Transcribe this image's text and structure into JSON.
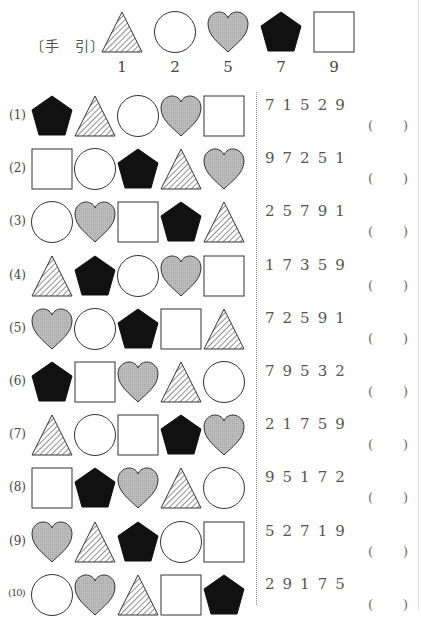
{
  "key": {
    "label": "〔手　引〕",
    "items": [
      {
        "shape": "hatched-triangle",
        "value": "1"
      },
      {
        "shape": "circle",
        "value": "2"
      },
      {
        "shape": "gray-heart",
        "value": "5"
      },
      {
        "shape": "black-pentagon",
        "value": "7"
      },
      {
        "shape": "square",
        "value": "9"
      }
    ]
  },
  "colors": {
    "heart_fill": "#b3b3b3",
    "pentagon_fill": "#111111",
    "stroke": "#333333"
  },
  "problems": [
    {
      "label": "(1)",
      "shapes": [
        "black-pentagon",
        "hatched-triangle",
        "circle",
        "gray-heart",
        "square"
      ],
      "digits": "71529",
      "answer_open": "(",
      "answer_close": ")"
    },
    {
      "label": "(2)",
      "shapes": [
        "square",
        "circle",
        "black-pentagon",
        "hatched-triangle",
        "gray-heart"
      ],
      "digits": "97251",
      "answer_open": "(",
      "answer_close": ")"
    },
    {
      "label": "(3)",
      "shapes": [
        "circle",
        "gray-heart",
        "square",
        "black-pentagon",
        "hatched-triangle"
      ],
      "digits": "25791",
      "answer_open": "(",
      "answer_close": ")"
    },
    {
      "label": "(4)",
      "shapes": [
        "hatched-triangle",
        "black-pentagon",
        "circle",
        "gray-heart",
        "square"
      ],
      "digits": "17359",
      "answer_open": "(",
      "answer_close": ")"
    },
    {
      "label": "(5)",
      "shapes": [
        "gray-heart",
        "circle",
        "black-pentagon",
        "square",
        "hatched-triangle"
      ],
      "digits": "72591",
      "answer_open": "(",
      "answer_close": ")"
    },
    {
      "label": "(6)",
      "shapes": [
        "black-pentagon",
        "square",
        "gray-heart",
        "hatched-triangle",
        "circle"
      ],
      "digits": "79532",
      "answer_open": "(",
      "answer_close": ")"
    },
    {
      "label": "(7)",
      "shapes": [
        "hatched-triangle",
        "circle",
        "square",
        "black-pentagon",
        "gray-heart"
      ],
      "digits": "21759",
      "answer_open": "(",
      "answer_close": ")"
    },
    {
      "label": "(8)",
      "shapes": [
        "square",
        "black-pentagon",
        "gray-heart",
        "hatched-triangle",
        "circle"
      ],
      "digits": "95172",
      "answer_open": "(",
      "answer_close": ")"
    },
    {
      "label": "(9)",
      "shapes": [
        "gray-heart",
        "hatched-triangle",
        "black-pentagon",
        "circle",
        "square"
      ],
      "digits": "52719",
      "answer_open": "(",
      "answer_close": ")"
    },
    {
      "label": "(10)",
      "shapes": [
        "circle",
        "gray-heart",
        "hatched-triangle",
        "square",
        "black-pentagon"
      ],
      "digits": "29175",
      "answer_open": "(",
      "answer_close": ")"
    }
  ]
}
